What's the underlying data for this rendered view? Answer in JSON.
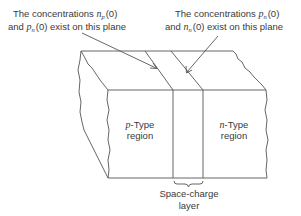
{
  "diagram": {
    "type": "pn-junction-block",
    "left_annotation": {
      "line1_prefix": "The concentrations ",
      "line1_symbol": "n",
      "line1_subscript": "p",
      "line1_suffix": "(0)",
      "line2_prefix": "and ",
      "line2_symbol": "p",
      "line2_subscript": "n",
      "line2_suffix": "(0) exist on this plane"
    },
    "right_annotation": {
      "line1_prefix": "The concentrations ",
      "line1_symbol": "p",
      "line1_subscript": "n",
      "line1_suffix": "(0)",
      "line2_prefix": "and ",
      "line2_symbol": "n",
      "line2_subscript": "n",
      "line2_suffix": "(0) exist on this plane"
    },
    "p_region": {
      "symbol": "p",
      "line1_suffix": "-Type",
      "line2": "region"
    },
    "n_region": {
      "symbol": "n",
      "line1_suffix": "-Type",
      "line2": "region"
    },
    "layer_label": {
      "line1": "Space-charge",
      "line2": "layer"
    },
    "colors": {
      "stroke": "#555555",
      "text": "#3a3a3a",
      "background": "#ffffff"
    }
  }
}
